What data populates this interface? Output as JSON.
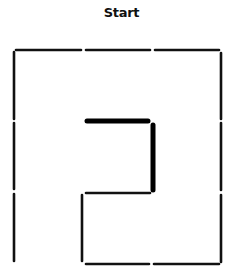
{
  "diagram": {
    "title": "Start",
    "type": "maze",
    "colors": {
      "wall": "#111111",
      "path": "#000000",
      "background": "#ffffff"
    },
    "walls": [
      {
        "id": "top-1",
        "x1": 16,
        "y1": 50,
        "x2": 81,
        "y2": 50
      },
      {
        "id": "top-2",
        "x1": 86,
        "y1": 50,
        "x2": 150,
        "y2": 50
      },
      {
        "id": "top-3",
        "x1": 155,
        "y1": 50,
        "x2": 219,
        "y2": 50
      },
      {
        "id": "left-1",
        "x1": 14,
        "y1": 52,
        "x2": 14,
        "y2": 119
      },
      {
        "id": "left-2",
        "x1": 14,
        "y1": 123,
        "x2": 14,
        "y2": 189
      },
      {
        "id": "left-3",
        "x1": 14,
        "y1": 194,
        "x2": 14,
        "y2": 261
      },
      {
        "id": "right-1",
        "x1": 221,
        "y1": 53,
        "x2": 221,
        "y2": 119
      },
      {
        "id": "right-2",
        "x1": 221,
        "y1": 123,
        "x2": 221,
        "y2": 190
      },
      {
        "id": "right-3",
        "x1": 221,
        "y1": 195,
        "x2": 221,
        "y2": 262
      },
      {
        "id": "inner-mid",
        "x1": 86,
        "y1": 193,
        "x2": 150,
        "y2": 193
      },
      {
        "id": "inner-left",
        "x1": 82,
        "y1": 195,
        "x2": 82,
        "y2": 261
      },
      {
        "id": "bottom-1",
        "x1": 86,
        "y1": 264,
        "x2": 149,
        "y2": 264
      },
      {
        "id": "bottom-2",
        "x1": 154,
        "y1": 264,
        "x2": 219,
        "y2": 264
      }
    ],
    "path": [
      {
        "id": "path-h",
        "x1": 87,
        "y1": 121,
        "x2": 148,
        "y2": 121
      },
      {
        "id": "path-v",
        "x1": 153,
        "y1": 125,
        "x2": 153,
        "y2": 190
      }
    ]
  }
}
